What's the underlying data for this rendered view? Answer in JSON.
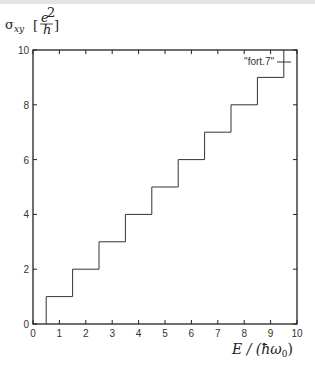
{
  "chart_data": {
    "type": "line",
    "title": "",
    "xlabel": "E / (ħω₀)",
    "ylabel": "σxy [e²/h]",
    "xlim": [
      0,
      10
    ],
    "ylim": [
      0,
      10
    ],
    "grid": false,
    "legend_position": "top-right (inside)",
    "x_ticks": [
      0,
      1,
      2,
      3,
      4,
      5,
      6,
      7,
      8,
      9,
      10
    ],
    "y_ticks": [
      0,
      2,
      4,
      6,
      8,
      10
    ],
    "series": [
      {
        "name": "\"fort.7\"",
        "style": "step",
        "x": [
          0.5,
          0.5,
          1.5,
          1.5,
          2.5,
          2.5,
          3.5,
          3.5,
          4.5,
          4.5,
          5.5,
          5.5,
          6.5,
          6.5,
          7.5,
          7.5,
          8.5,
          8.5,
          9.5,
          9.5
        ],
        "y": [
          0,
          1,
          1,
          2,
          2,
          3,
          3,
          4,
          4,
          5,
          5,
          6,
          6,
          7,
          7,
          8,
          8,
          9,
          9,
          10
        ]
      }
    ]
  },
  "labels": {
    "ylabel_sigma": "σ",
    "ylabel_sub": "xy",
    "ylabel_num": "e",
    "ylabel_sup": "2",
    "ylabel_den": "h",
    "xlabel": "E / (ħω",
    "xlabel_sub": "0",
    "xlabel_close": ")",
    "legend": "\"fort.7\""
  }
}
